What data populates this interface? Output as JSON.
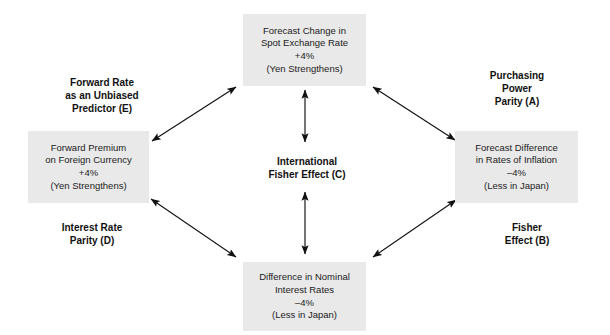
{
  "diagram": {
    "background_color": "#ffffff",
    "box_fill_color": "#e9e9e9",
    "line_color": "#111111",
    "boxes": [
      {
        "id": "forecast-change-spot-rate",
        "position": "top",
        "lines": [
          "Forecast Change in",
          "Spot Exchange Rate",
          "+4%",
          "(Yen Strengthens)"
        ]
      },
      {
        "id": "forward-premium-foreign-currency",
        "position": "left",
        "lines": [
          "Forward Premium",
          "on Foreign Currency",
          "+4%",
          "(Yen Strengthens)"
        ]
      },
      {
        "id": "forecast-difference-inflation",
        "position": "right",
        "lines": [
          "Forecast Difference",
          "in Rates of Inflation",
          "–4%",
          "(Less in Japan)"
        ]
      },
      {
        "id": "difference-nominal-interest-rates",
        "position": "bottom",
        "lines": [
          "Difference in Nominal",
          "Interest Rates",
          "–4%",
          "(Less in Japan)"
        ]
      }
    ],
    "center": {
      "id": "international-fisher-effect",
      "code": "C",
      "lines": [
        "International",
        "Fisher Effect (C)"
      ]
    },
    "corner_labels": [
      {
        "id": "forward-rate-unbiased-predictor",
        "code": "E",
        "position": "top-left",
        "lines": [
          "Forward Rate",
          "as an Unbiased",
          "Predictor (E)"
        ]
      },
      {
        "id": "purchasing-power-parity",
        "code": "A",
        "position": "top-right",
        "lines": [
          "Purchasing",
          "Power",
          "Parity (A)"
        ]
      },
      {
        "id": "interest-rate-parity",
        "code": "D",
        "position": "bottom-left",
        "lines": [
          "Interest Rate",
          "Parity (D)"
        ]
      },
      {
        "id": "fisher-effect",
        "code": "B",
        "position": "bottom-right",
        "lines": [
          "Fisher",
          "Effect (B)"
        ]
      }
    ],
    "connectors": [
      {
        "id": "arrow-top-left-diagonal",
        "from": "forward-premium-foreign-currency",
        "to": "forecast-change-spot-rate",
        "style": "double-headed"
      },
      {
        "id": "arrow-top-right-diagonal",
        "from": "forecast-change-spot-rate",
        "to": "forecast-difference-inflation",
        "style": "double-headed"
      },
      {
        "id": "arrow-bottom-left-diagonal",
        "from": "forward-premium-foreign-currency",
        "to": "difference-nominal-interest-rates",
        "style": "double-headed"
      },
      {
        "id": "arrow-bottom-right-diagonal",
        "from": "difference-nominal-interest-rates",
        "to": "forecast-difference-inflation",
        "style": "double-headed"
      },
      {
        "id": "arrow-center-upper-vertical",
        "from": "international-fisher-effect",
        "to": "forecast-change-spot-rate",
        "style": "double-headed"
      },
      {
        "id": "arrow-center-lower-vertical",
        "from": "international-fisher-effect",
        "to": "difference-nominal-interest-rates",
        "style": "double-headed"
      }
    ]
  }
}
